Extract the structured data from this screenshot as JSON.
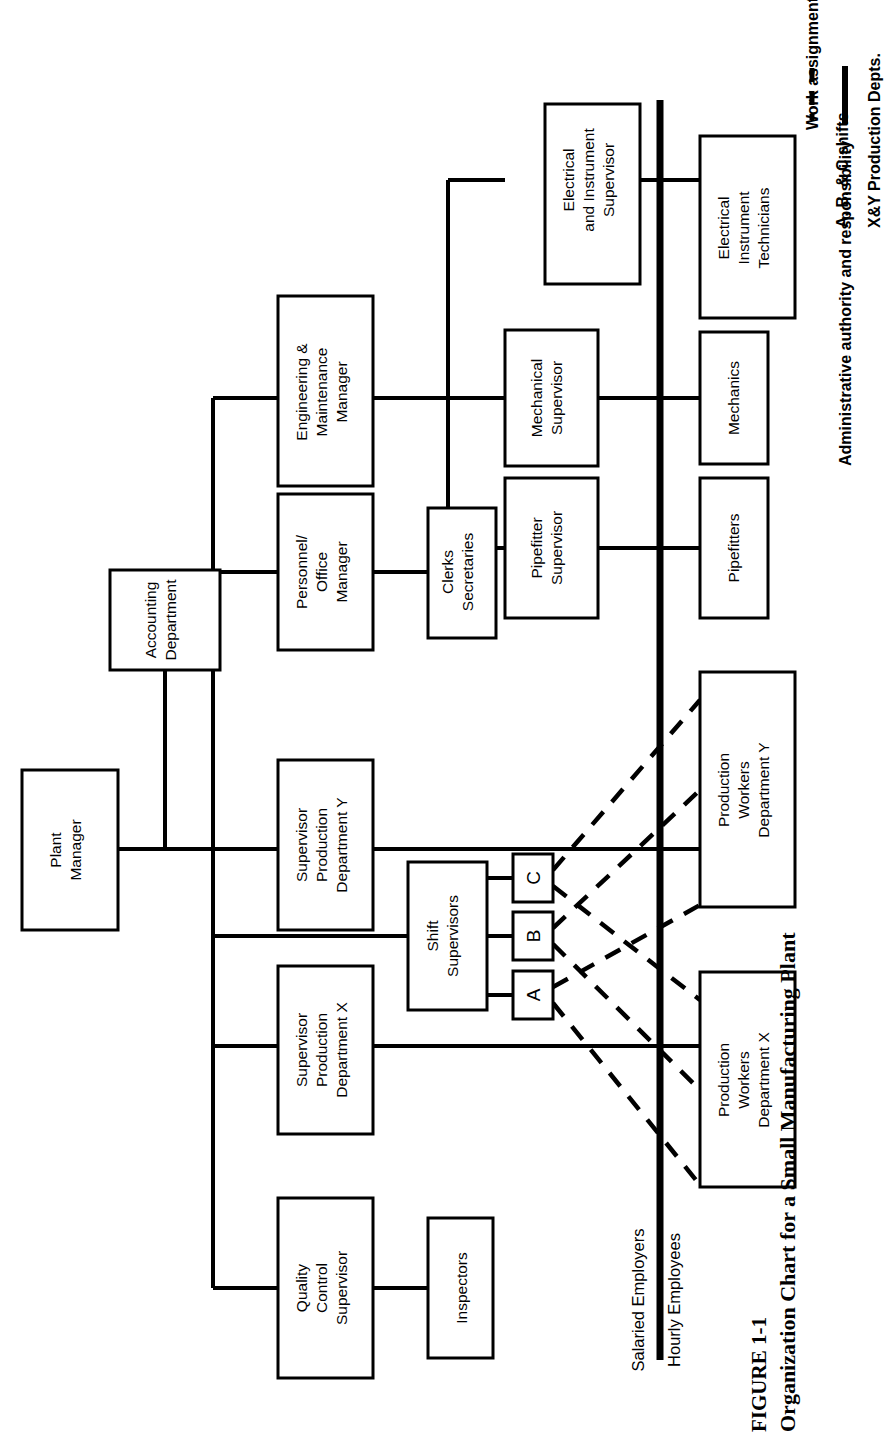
{
  "figure": {
    "label": "FIGURE 1-1",
    "caption": "Organization Chart for a Small Manufacturing Plant"
  },
  "legend": {
    "items": [
      {
        "style": "dashed",
        "text": "Work assignments only",
        "note": "A, B, & C shifts"
      },
      {
        "style": "solid",
        "text": "Administrative authority and responsibility",
        "note": "X&Y Production Depts."
      }
    ]
  },
  "divider": {
    "above_label": "Salaried Employers",
    "below_label": "Hourly Employees"
  },
  "nodes": {
    "plant_manager": "Plant Manager",
    "accounting_department": "Accounting Department",
    "quality_control_supervisor": "Quality Control Supervisor",
    "inspectors": "Inspectors",
    "supervisor_production_x": "Supervisor Production Department X",
    "supervisor_production_y": "Supervisor Production Department Y",
    "shift_supervisors": "Shift Supervisors",
    "shift_a": "A",
    "shift_b": "B",
    "shift_c": "C",
    "production_workers_x": "Production Workers Department X",
    "production_workers_y": "Production Workers Department Y",
    "personnel_office_manager": "Personnel/ Office Manager",
    "clerks_secretaries": "Clerks Secretaries",
    "engineering_maintenance_manager": "Engineering & Maintenance Manager",
    "pipefitter_supervisor": "Pipefitter Supervisor",
    "mechanical_supervisor": "Mechanical Supervisor",
    "electrical_instrument_supervisor": "Electrical and Instrument Supervisor",
    "pipefitters": "Pipefitters",
    "mechanics": "Mechanics",
    "electrical_instrument_technicians": "Electrical Instrument Technicians"
  },
  "node_lines": {
    "plant_manager": [
      "Plant",
      "Manager"
    ],
    "accounting_department": [
      "Accounting",
      "Department"
    ],
    "quality_control_supervisor": [
      "Quality",
      "Control",
      "Supervisor"
    ],
    "inspectors": [
      "Inspectors"
    ],
    "supervisor_production_x": [
      "Supervisor",
      "Production",
      "Department X"
    ],
    "supervisor_production_y": [
      "Supervisor",
      "Production",
      "Department Y"
    ],
    "shift_supervisors": [
      "Shift",
      "Supervisors"
    ],
    "production_workers_x": [
      "Production",
      "Workers",
      "Department X"
    ],
    "production_workers_y": [
      "Production",
      "Workers",
      "Department Y"
    ],
    "personnel_office_manager": [
      "Personnel/",
      "Office",
      "Manager"
    ],
    "clerks_secretaries": [
      "Clerks",
      "Secretaries"
    ],
    "engineering_maintenance_manager": [
      "Engineering &",
      "Maintenance",
      "Manager"
    ],
    "pipefitter_supervisor": [
      "Pipefitter",
      "Supervisor"
    ],
    "mechanical_supervisor": [
      "Mechanical",
      "Supervisor"
    ],
    "electrical_instrument_supervisor": [
      "Electrical",
      "and Instrument",
      "Supervisor"
    ],
    "pipefitters": [
      "Pipefitters"
    ],
    "mechanics": [
      "Mechanics"
    ],
    "electrical_instrument_technicians": [
      "Electrical",
      "Instrument",
      "Technicians"
    ]
  },
  "colors": {
    "ink": "#000000",
    "paper": "#ffffff"
  }
}
